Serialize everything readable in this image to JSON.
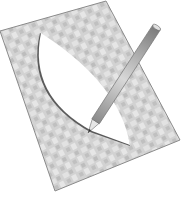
{
  "illustration": {
    "title": "Pencil tracing a lens shape on a patterned sheet",
    "sheet": {
      "fill": "#d0d0d0",
      "pattern_light": "#e4e4e4",
      "pattern_dark": "#b8b8b8",
      "edge": "#8a8a8a"
    },
    "cutout": {
      "shape": "vesica / lens",
      "fill": "#ffffff",
      "shadow": "#555555"
    },
    "pencil": {
      "body": "#b5b5b5",
      "body_dark": "#7a7a7a",
      "tip": "#e8e8e8",
      "lead": "#333333"
    }
  }
}
